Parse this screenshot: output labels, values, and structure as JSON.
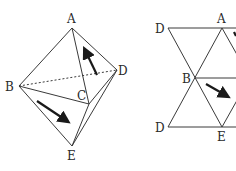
{
  "figure": {
    "left": {
      "title": "octahedron-style solid",
      "labels": {
        "A": "A",
        "B": "B",
        "C": "C",
        "D": "D",
        "E": "E"
      },
      "arrows": 2,
      "hidden_edge": "B-D"
    },
    "right": {
      "title": "unfolded net",
      "labels": {
        "D_top": "D",
        "A": "A",
        "B": "B",
        "D_bottom": "D",
        "E": "E"
      },
      "arrows": 2
    }
  },
  "colors": {
    "ink": "#3a3a3a",
    "arrow": "#1a1a1a",
    "background": "#ffffff"
  }
}
